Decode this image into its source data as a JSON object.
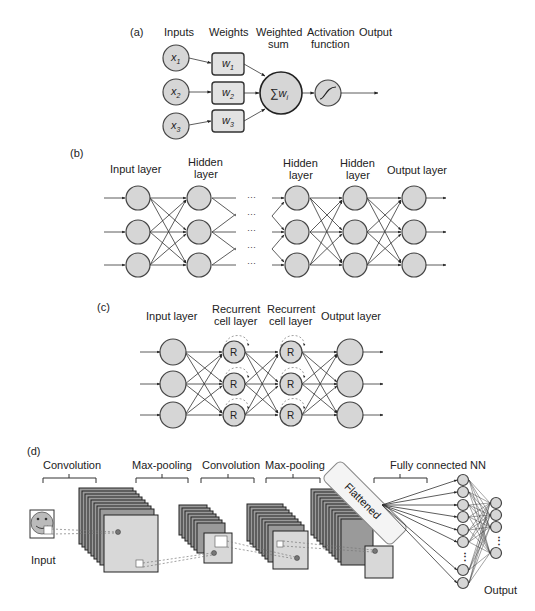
{
  "panel_a": {
    "tag": "(a)",
    "headers": {
      "inputs": "Inputs",
      "weights": "Weights",
      "weighted_sum_1": "Weighted",
      "weighted_sum_2": "sum",
      "activation_1": "Activation",
      "activation_2": "function",
      "output": "Output"
    },
    "inputs": [
      {
        "label": "x",
        "sub": "1"
      },
      {
        "label": "x",
        "sub": "2"
      },
      {
        "label": "x",
        "sub": "3"
      }
    ],
    "weights": [
      {
        "label": "w",
        "sub": "1"
      },
      {
        "label": "w",
        "sub": "2"
      },
      {
        "label": "w",
        "sub": "3"
      }
    ],
    "sum_node": {
      "symbol": "∑",
      "label": "w",
      "sub": "i"
    },
    "activation_icon": "sigmoid-curve-icon"
  },
  "panel_b": {
    "tag": "(b)",
    "layers": [
      {
        "line1": "Input layer",
        "line2": ""
      },
      {
        "line1": "Hidden",
        "line2": "layer"
      },
      {
        "line1": "Hidden",
        "line2": "layer"
      },
      {
        "line1": "Hidden",
        "line2": "layer"
      },
      {
        "line1": "Output layer",
        "line2": ""
      }
    ],
    "ellipsis": "···"
  },
  "panel_c": {
    "tag": "(c)",
    "layers": [
      {
        "line1": "Input layer",
        "line2": ""
      },
      {
        "line1": "Recurrent",
        "line2": "cell layer"
      },
      {
        "line1": "Recurrent",
        "line2": "cell layer"
      },
      {
        "line1": "Output layer",
        "line2": ""
      }
    ],
    "cell_label": "R"
  },
  "panel_d": {
    "tag": "(d)",
    "stages": {
      "conv1": "Convolution",
      "pool1": "Max-pooling",
      "conv2": "Convolution",
      "pool2": "Max-pooling",
      "fc": "Fully connected NN"
    },
    "input_label": "Input",
    "flattened_label": "Flattened",
    "output_label": "Output",
    "vertical_ellipsis": "⋮"
  }
}
